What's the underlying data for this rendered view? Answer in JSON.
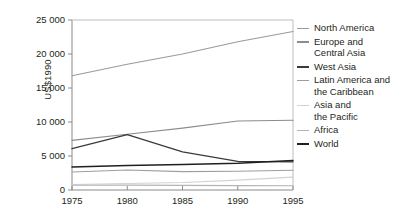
{
  "chart_data": {
    "type": "line",
    "title": "",
    "xlabel": "",
    "ylabel": "US$1990",
    "x": [
      1975,
      1980,
      1985,
      1990,
      1995
    ],
    "xlim": [
      1975,
      1995
    ],
    "ylim": [
      0,
      25000
    ],
    "yticks": [
      0,
      5000,
      10000,
      15000,
      20000,
      25000
    ],
    "ytick_labels": [
      "0",
      "5 000",
      "10 000",
      "15 000",
      "20 000",
      "25 000"
    ],
    "xticks": [
      1975,
      1980,
      1985,
      1990,
      1995
    ],
    "xtick_labels": [
      "1975",
      "1980",
      "1985",
      "1990",
      "1995"
    ],
    "grid": false,
    "legend_position": "right",
    "series": [
      {
        "name": "North America",
        "color": "#9a9a9a",
        "width": 1.1,
        "values": [
          16800,
          18500,
          20000,
          21800,
          23300
        ]
      },
      {
        "name": "Europe and\nCentral Asia",
        "color": "#8c8c8c",
        "width": 1.1,
        "values": [
          7300,
          8200,
          9100,
          10150,
          10250
        ]
      },
      {
        "name": "West Asia",
        "color": "#3a3a3a",
        "width": 1.3,
        "values": [
          6100,
          8150,
          5600,
          4200,
          4150
        ]
      },
      {
        "name": "Latin America and\nthe Caribbean",
        "color": "#9e9e9e",
        "width": 1.1,
        "values": [
          2650,
          2950,
          2700,
          2750,
          2900
        ]
      },
      {
        "name": "Asia and\nthe Pacific",
        "color": "#d2d2d2",
        "width": 1.1,
        "values": [
          800,
          950,
          1100,
          1450,
          1900
        ]
      },
      {
        "name": "Africa",
        "color": "#b4b4b4",
        "width": 1.1,
        "values": [
          700,
          720,
          680,
          640,
          620
        ]
      },
      {
        "name": "World",
        "color": "#231f20",
        "width": 1.5,
        "values": [
          3400,
          3600,
          3750,
          3950,
          4350
        ]
      }
    ]
  },
  "axes": {
    "axis_color": "#8a8a8a",
    "tick_color": "#8a8a8a"
  }
}
